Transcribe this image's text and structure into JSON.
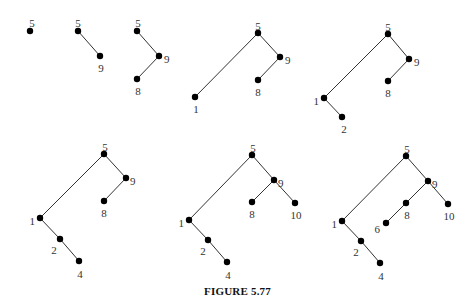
{
  "caption": "FIGURE 5.77",
  "trees": [
    {
      "step": 1,
      "nodes": [
        {
          "key": "5",
          "x": 30,
          "y": 31,
          "lx": 32,
          "ly": 24,
          "anchor": "middle"
        }
      ],
      "edges": []
    },
    {
      "step": 2,
      "nodes": [
        {
          "key": "5",
          "x": 78,
          "y": 31,
          "lx": 78,
          "ly": 24,
          "anchor": "middle"
        },
        {
          "key": "9",
          "x": 100,
          "y": 56,
          "lx": 101,
          "ly": 69,
          "anchor": "middle"
        }
      ],
      "edges": [
        [
          "5",
          "9"
        ]
      ]
    },
    {
      "step": 3,
      "nodes": [
        {
          "key": "5",
          "x": 137,
          "y": 31,
          "lx": 138,
          "ly": 24,
          "anchor": "middle"
        },
        {
          "key": "9",
          "x": 159,
          "y": 56,
          "lx": 164,
          "ly": 60,
          "anchor": "start"
        },
        {
          "key": "8",
          "x": 137,
          "y": 79,
          "lx": 138,
          "ly": 92,
          "anchor": "middle"
        }
      ],
      "edges": [
        [
          "5",
          "9"
        ],
        [
          "9",
          "8"
        ]
      ]
    },
    {
      "step": 4,
      "nodes": [
        {
          "key": "5",
          "x": 258,
          "y": 33,
          "lx": 258,
          "ly": 27,
          "anchor": "middle"
        },
        {
          "key": "9",
          "x": 280,
          "y": 57,
          "lx": 285,
          "ly": 61,
          "anchor": "start"
        },
        {
          "key": "8",
          "x": 258,
          "y": 80,
          "lx": 258,
          "ly": 93,
          "anchor": "middle"
        },
        {
          "key": "1",
          "x": 195,
          "y": 97,
          "lx": 196,
          "ly": 110,
          "anchor": "middle"
        }
      ],
      "edges": [
        [
          "5",
          "9"
        ],
        [
          "9",
          "8"
        ],
        [
          "5",
          "1"
        ]
      ]
    },
    {
      "step": 5,
      "nodes": [
        {
          "key": "5",
          "x": 388,
          "y": 34,
          "lx": 388,
          "ly": 28,
          "anchor": "middle"
        },
        {
          "key": "9",
          "x": 409,
          "y": 59,
          "lx": 414,
          "ly": 63,
          "anchor": "start"
        },
        {
          "key": "8",
          "x": 388,
          "y": 81,
          "lx": 388,
          "ly": 94,
          "anchor": "middle"
        },
        {
          "key": "1",
          "x": 324,
          "y": 98,
          "lx": 319,
          "ly": 102,
          "anchor": "end"
        },
        {
          "key": "2",
          "x": 342,
          "y": 117,
          "lx": 344,
          "ly": 130,
          "anchor": "middle"
        }
      ],
      "edges": [
        [
          "5",
          "9"
        ],
        [
          "9",
          "8"
        ],
        [
          "5",
          "1"
        ],
        [
          "1",
          "2"
        ]
      ]
    },
    {
      "step": 6,
      "nodes": [
        {
          "key": "5",
          "x": 104,
          "y": 154,
          "lx": 105,
          "ly": 148,
          "anchor": "middle"
        },
        {
          "key": "9",
          "x": 126,
          "y": 178,
          "lx": 130,
          "ly": 182,
          "anchor": "start"
        },
        {
          "key": "8",
          "x": 104,
          "y": 201,
          "lx": 104,
          "ly": 214,
          "anchor": "middle"
        },
        {
          "key": "1",
          "x": 40,
          "y": 218,
          "lx": 35,
          "ly": 222,
          "anchor": "end"
        },
        {
          "key": "2",
          "x": 60,
          "y": 239,
          "lx": 54,
          "ly": 251,
          "anchor": "middle"
        },
        {
          "key": "4",
          "x": 79,
          "y": 261,
          "lx": 80,
          "ly": 275,
          "anchor": "middle"
        }
      ],
      "edges": [
        [
          "5",
          "9"
        ],
        [
          "9",
          "8"
        ],
        [
          "5",
          "1"
        ],
        [
          "1",
          "2"
        ],
        [
          "2",
          "4"
        ]
      ]
    },
    {
      "step": 7,
      "nodes": [
        {
          "key": "5",
          "x": 252,
          "y": 155,
          "lx": 253,
          "ly": 149,
          "anchor": "middle"
        },
        {
          "key": "9",
          "x": 274,
          "y": 180,
          "lx": 278,
          "ly": 184,
          "anchor": "start"
        },
        {
          "key": "8",
          "x": 252,
          "y": 202,
          "lx": 252,
          "ly": 215,
          "anchor": "middle"
        },
        {
          "key": "10",
          "x": 295,
          "y": 203,
          "lx": 296,
          "ly": 216,
          "anchor": "middle"
        },
        {
          "key": "1",
          "x": 189,
          "y": 220,
          "lx": 184,
          "ly": 224,
          "anchor": "end"
        },
        {
          "key": "2",
          "x": 208,
          "y": 240,
          "lx": 203,
          "ly": 252,
          "anchor": "middle"
        },
        {
          "key": "4",
          "x": 227,
          "y": 262,
          "lx": 228,
          "ly": 276,
          "anchor": "middle"
        }
      ],
      "edges": [
        [
          "5",
          "9"
        ],
        [
          "9",
          "8"
        ],
        [
          "9",
          "10"
        ],
        [
          "5",
          "1"
        ],
        [
          "1",
          "2"
        ],
        [
          "2",
          "4"
        ]
      ]
    },
    {
      "step": 8,
      "nodes": [
        {
          "key": "5",
          "x": 406,
          "y": 156,
          "lx": 407,
          "ly": 150,
          "anchor": "middle"
        },
        {
          "key": "9",
          "x": 428,
          "y": 181,
          "lx": 432,
          "ly": 185,
          "anchor": "start"
        },
        {
          "key": "8",
          "x": 406,
          "y": 203,
          "lx": 407,
          "ly": 216,
          "anchor": "middle"
        },
        {
          "key": "10",
          "x": 448,
          "y": 204,
          "lx": 449,
          "ly": 217,
          "anchor": "middle"
        },
        {
          "key": "6",
          "x": 386,
          "y": 223,
          "lx": 380,
          "ly": 230,
          "anchor": "end"
        },
        {
          "key": "1",
          "x": 342,
          "y": 221,
          "lx": 337,
          "ly": 225,
          "anchor": "end"
        },
        {
          "key": "2",
          "x": 361,
          "y": 241,
          "lx": 356,
          "ly": 253,
          "anchor": "middle"
        },
        {
          "key": "4",
          "x": 380,
          "y": 263,
          "lx": 381,
          "ly": 277,
          "anchor": "middle"
        }
      ],
      "edges": [
        [
          "5",
          "9"
        ],
        [
          "9",
          "8"
        ],
        [
          "9",
          "10"
        ],
        [
          "8",
          "6"
        ],
        [
          "5",
          "1"
        ],
        [
          "1",
          "2"
        ],
        [
          "2",
          "4"
        ]
      ]
    }
  ]
}
